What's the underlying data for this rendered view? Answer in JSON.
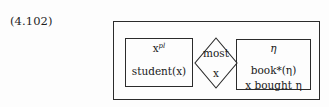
{
  "figure": {
    "equation_number": "(4.102)",
    "kind": "duplex-condition"
  },
  "restrictor": {
    "universe_base": "x",
    "universe_superscript": "pl",
    "condition": "student(x)"
  },
  "quantifier": {
    "determiner": "most",
    "variable": "x"
  },
  "scope": {
    "universe": "η",
    "condition_1": "book*(η)",
    "condition_2": "x bought η"
  },
  "style": {
    "line_color": "#2b2b2b",
    "text_color": "#1a1a1a",
    "background": "#fdfdfd"
  }
}
